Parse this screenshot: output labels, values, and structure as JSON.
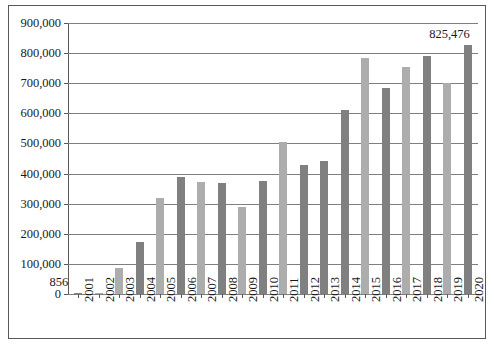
{
  "chart_data": {
    "type": "bar",
    "title": "",
    "subtitle": "",
    "xlabel": "",
    "ylabel": "",
    "ylim": [
      0,
      900000
    ],
    "ytick_labels": [
      "900,000",
      "800,000",
      "700,000",
      "600,000",
      "500,000",
      "400,000",
      "300,000",
      "200,000",
      "100,000",
      "0"
    ],
    "ytick_values": [
      900000,
      800000,
      700000,
      600000,
      500000,
      400000,
      300000,
      200000,
      100000,
      0
    ],
    "grid": "horizontal",
    "legend": "none",
    "categories": [
      "2001",
      "2002",
      "2003",
      "2004",
      "2005",
      "2006",
      "2007",
      "2008",
      "2009",
      "2010",
      "2011",
      "2012",
      "2013",
      "2014",
      "2015",
      "2016",
      "2017",
      "2018",
      "2019",
      "2020"
    ],
    "values": [
      856,
      3500,
      88000,
      172000,
      320000,
      390000,
      372000,
      368000,
      288000,
      375000,
      505000,
      430000,
      442000,
      610000,
      785000,
      683000,
      755000,
      790000,
      702000,
      825476
    ],
    "bar_colors": [
      "#808080",
      "#adadad",
      "#adadad",
      "#808080",
      "#adadad",
      "#808080",
      "#adadad",
      "#808080",
      "#adadad",
      "#808080",
      "#adadad",
      "#808080",
      "#808080",
      "#808080",
      "#adadad",
      "#808080",
      "#adadad",
      "#808080",
      "#adadad",
      "#808080"
    ],
    "annotations": [
      {
        "label": "856",
        "category": "2001"
      },
      {
        "label": "825,476",
        "category": "2020"
      }
    ],
    "colors": {
      "light_bar": "#adadad",
      "dark_bar": "#808080",
      "gridline": "#7f7f7f",
      "axis": "#595959",
      "text": "#1a1a1a",
      "background": "#ffffff"
    }
  }
}
